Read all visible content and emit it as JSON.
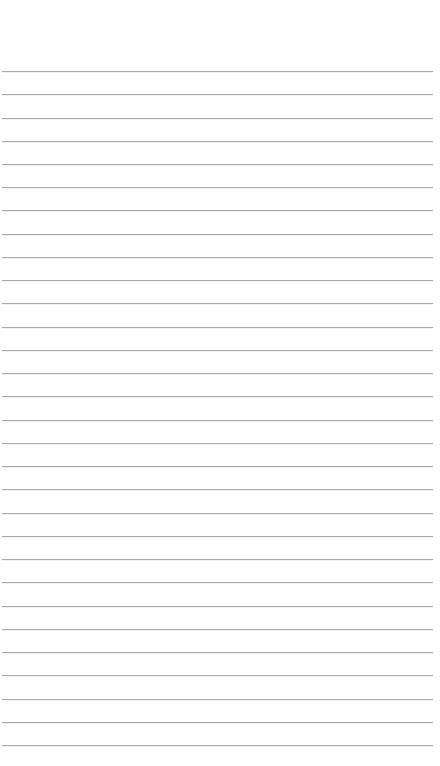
{
  "document": {
    "type": "ruled-paper",
    "title": "",
    "body_text": "",
    "width": 440,
    "height": 766,
    "background_color": "#ffffff"
  },
  "ruling": {
    "line_color": "#a9a9ad",
    "line_thickness_px": 1,
    "line_spacing_px": 23.4,
    "first_line_y": 71,
    "last_line_y": 745,
    "line_start_x": 2,
    "line_end_x": 433,
    "line_count": 30,
    "top_margin_px": 71,
    "bottom_margin_px": 19,
    "lines": [
      {
        "index": 1,
        "y": 71,
        "text": ""
      },
      {
        "index": 2,
        "y": 94.2,
        "text": ""
      },
      {
        "index": 3,
        "y": 117.5,
        "text": ""
      },
      {
        "index": 4,
        "y": 140.7,
        "text": ""
      },
      {
        "index": 5,
        "y": 164.0,
        "text": ""
      },
      {
        "index": 6,
        "y": 187.2,
        "text": ""
      },
      {
        "index": 7,
        "y": 210.4,
        "text": ""
      },
      {
        "index": 8,
        "y": 233.7,
        "text": ""
      },
      {
        "index": 9,
        "y": 256.9,
        "text": ""
      },
      {
        "index": 10,
        "y": 280.2,
        "text": ""
      },
      {
        "index": 11,
        "y": 303.4,
        "text": ""
      },
      {
        "index": 12,
        "y": 326.6,
        "text": ""
      },
      {
        "index": 13,
        "y": 349.9,
        "text": ""
      },
      {
        "index": 14,
        "y": 373.1,
        "text": ""
      },
      {
        "index": 15,
        "y": 396.4,
        "text": ""
      },
      {
        "index": 16,
        "y": 419.6,
        "text": ""
      },
      {
        "index": 17,
        "y": 442.8,
        "text": ""
      },
      {
        "index": 18,
        "y": 466.1,
        "text": ""
      },
      {
        "index": 19,
        "y": 489.3,
        "text": ""
      },
      {
        "index": 20,
        "y": 512.6,
        "text": ""
      },
      {
        "index": 21,
        "y": 535.8,
        "text": ""
      },
      {
        "index": 22,
        "y": 559.0,
        "text": ""
      },
      {
        "index": 23,
        "y": 582.3,
        "text": ""
      },
      {
        "index": 24,
        "y": 605.5,
        "text": ""
      },
      {
        "index": 25,
        "y": 628.8,
        "text": ""
      },
      {
        "index": 26,
        "y": 652.0,
        "text": ""
      },
      {
        "index": 27,
        "y": 675.2,
        "text": ""
      },
      {
        "index": 28,
        "y": 698.5,
        "text": ""
      },
      {
        "index": 29,
        "y": 721.7,
        "text": ""
      },
      {
        "index": 30,
        "y": 745.0,
        "text": ""
      }
    ]
  }
}
